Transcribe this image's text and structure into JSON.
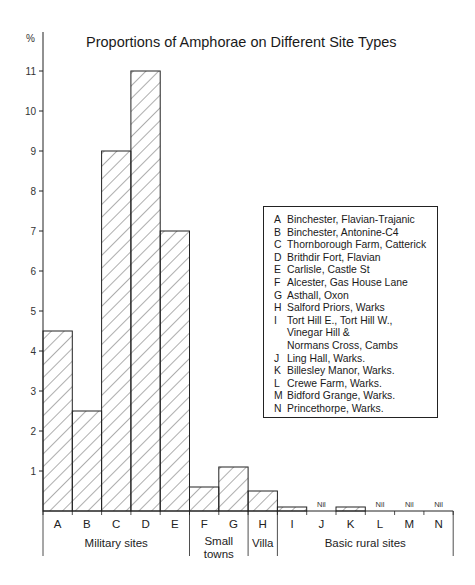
{
  "chart_data": {
    "type": "bar",
    "title": "Proportions of Amphorae on Different Site Types",
    "ylabel": "%",
    "xlabel": "",
    "ylim": [
      0,
      11.5
    ],
    "yticks": [
      1,
      2,
      3,
      4,
      5,
      6,
      7,
      8,
      9,
      10,
      11
    ],
    "grid": false,
    "categories": [
      "A",
      "B",
      "C",
      "D",
      "E",
      "F",
      "G",
      "H",
      "I",
      "J",
      "K",
      "L",
      "M",
      "N"
    ],
    "values": [
      4.5,
      2.5,
      9,
      11,
      7,
      0.6,
      1.1,
      0.5,
      0.1,
      0,
      0.1,
      0,
      0,
      0
    ],
    "nil_labels": {
      "J": "Nil",
      "L": "Nil",
      "M": "Nil",
      "N": "Nil"
    },
    "groups": [
      {
        "label": "Military sites",
        "categories": [
          "A",
          "B",
          "C",
          "D",
          "E"
        ]
      },
      {
        "label": "Small\ntowns",
        "categories": [
          "F",
          "G"
        ]
      },
      {
        "label": "Villa",
        "categories": [
          "H"
        ]
      },
      {
        "label": "Basic rural sites",
        "categories": [
          "I",
          "J",
          "K",
          "L",
          "M",
          "N"
        ]
      }
    ],
    "legend_position": "right-inside",
    "legend": [
      {
        "key": "A",
        "label": "Binchester, Flavian-Trajanic"
      },
      {
        "key": "B",
        "label": "Binchester, Antonine-C4"
      },
      {
        "key": "C",
        "label": "Thornborough Farm, Catterick"
      },
      {
        "key": "D",
        "label": "Brithdir Fort, Flavian"
      },
      {
        "key": "E",
        "label": "Carlisle, Castle St"
      },
      {
        "key": "F",
        "label": "Alcester, Gas House Lane"
      },
      {
        "key": "G",
        "label": "Asthall, Oxon"
      },
      {
        "key": "H",
        "label": "Salford Priors, Warks"
      },
      {
        "key": "I",
        "label": "Tort Hill E., Tort Hill W.,\nVinegar Hill &\nNormans Cross, Cambs"
      },
      {
        "key": "J",
        "label": "Ling Hall, Warks."
      },
      {
        "key": "K",
        "label": "Billesley Manor, Warks."
      },
      {
        "key": "L",
        "label": "Crewe Farm, Warks."
      },
      {
        "key": "M",
        "label": "Bidford Grange, Warks."
      },
      {
        "key": "N",
        "label": "Princethorpe, Warks."
      }
    ],
    "colors": {
      "stroke": "#222222",
      "hatch": "#333333",
      "background": "#ffffff"
    }
  }
}
